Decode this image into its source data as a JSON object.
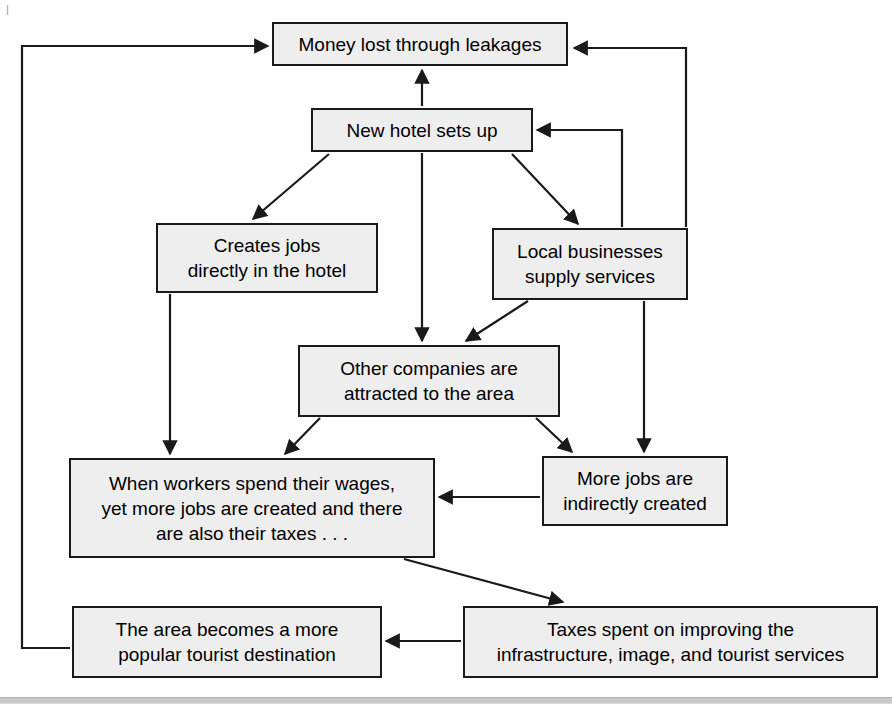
{
  "diagram": {
    "type": "flowchart",
    "background_color": "#ffffff",
    "node_fill_color": "#eeeeee",
    "node_border_color": "#1a1a1a",
    "arrow_color": "#1a1a1a",
    "nodes": [
      {
        "id": "money-lost",
        "label": "Money lost through leakages",
        "x": 272,
        "y": 22,
        "width": 296,
        "height": 44
      },
      {
        "id": "new-hotel",
        "label": "New hotel sets up",
        "x": 311,
        "y": 108,
        "width": 222,
        "height": 44
      },
      {
        "id": "creates-jobs",
        "label": "Creates jobs\ndirectly in the hotel",
        "x": 156,
        "y": 223,
        "width": 222,
        "height": 70
      },
      {
        "id": "local-businesses",
        "label": "Local businesses\nsupply services",
        "x": 492,
        "y": 228,
        "width": 196,
        "height": 72
      },
      {
        "id": "other-companies",
        "label": "Other companies are\nattracted to the area",
        "x": 298,
        "y": 345,
        "width": 262,
        "height": 72
      },
      {
        "id": "when-workers-spend",
        "label": "When workers spend their wages,\nyet more jobs are created and there\nare also their taxes . . .",
        "x": 69,
        "y": 458,
        "width": 366,
        "height": 100
      },
      {
        "id": "more-jobs",
        "label": "More jobs are\nindirectly created",
        "x": 542,
        "y": 456,
        "width": 186,
        "height": 70
      },
      {
        "id": "area-popular",
        "label": "The area becomes a more\npopular tourist destination",
        "x": 72,
        "y": 606,
        "width": 310,
        "height": 72
      },
      {
        "id": "taxes-spent",
        "label": "Taxes spent on improving the\ninfrastructure, image, and tourist services",
        "x": 463,
        "y": 606,
        "width": 415,
        "height": 72
      }
    ],
    "edges": [
      {
        "id": "edge-hotel-to-money",
        "from": "new-hotel",
        "to": "money-lost",
        "style": "straight-vertical-up"
      },
      {
        "id": "edge-hotel-to-creates-jobs",
        "from": "new-hotel",
        "to": "creates-jobs",
        "style": "diagonal-down-left"
      },
      {
        "id": "edge-hotel-to-local-businesses",
        "from": "new-hotel",
        "to": "local-businesses",
        "style": "diagonal-down-right"
      },
      {
        "id": "edge-hotel-to-other-companies",
        "from": "new-hotel",
        "to": "other-companies",
        "style": "straight-vertical-down"
      },
      {
        "id": "edge-creates-jobs-to-when-workers",
        "from": "creates-jobs",
        "to": "when-workers-spend",
        "style": "straight-vertical-down"
      },
      {
        "id": "edge-local-businesses-to-other-companies",
        "from": "local-businesses",
        "to": "other-companies",
        "style": "diagonal-down-left"
      },
      {
        "id": "edge-local-businesses-to-more-jobs",
        "from": "local-businesses",
        "to": "more-jobs",
        "style": "straight-vertical-down"
      },
      {
        "id": "edge-local-businesses-to-new-hotel",
        "from": "local-businesses",
        "to": "new-hotel",
        "style": "elbow-up-left"
      },
      {
        "id": "edge-local-businesses-to-money-lost",
        "from": "local-businesses",
        "to": "money-lost",
        "style": "elbow-up-left-outer"
      },
      {
        "id": "edge-other-companies-to-when-workers",
        "from": "other-companies",
        "to": "when-workers-spend",
        "style": "diagonal-down-left"
      },
      {
        "id": "edge-other-companies-to-more-jobs",
        "from": "other-companies",
        "to": "more-jobs",
        "style": "diagonal-down-right"
      },
      {
        "id": "edge-more-jobs-to-when-workers",
        "from": "more-jobs",
        "to": "when-workers-spend",
        "style": "straight-horizontal-left"
      },
      {
        "id": "edge-when-workers-to-taxes",
        "from": "when-workers-spend",
        "to": "taxes-spent",
        "style": "diagonal-down-right"
      },
      {
        "id": "edge-taxes-to-area-popular",
        "from": "taxes-spent",
        "to": "area-popular",
        "style": "straight-horizontal-left"
      },
      {
        "id": "edge-area-popular-to-money-lost",
        "from": "area-popular",
        "to": "money-lost",
        "style": "elbow-left-up-right"
      }
    ]
  },
  "page": {
    "corner_mark": "|",
    "bottom_rule_color": "#c9c9c9"
  }
}
